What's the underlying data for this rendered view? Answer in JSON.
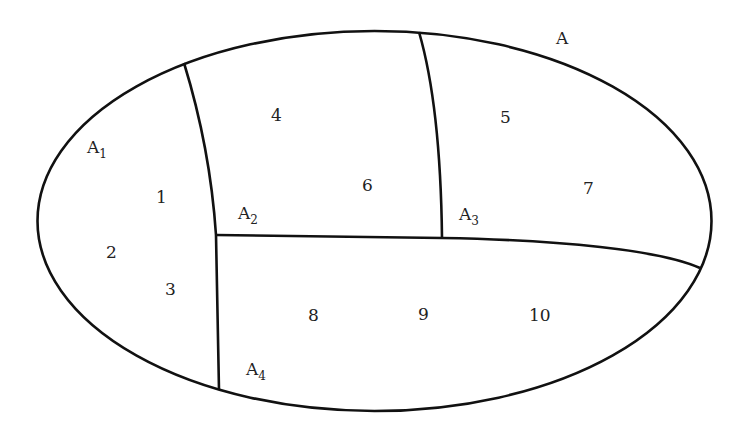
{
  "diagram": {
    "type": "region-partition",
    "stroke_color": "#111111",
    "background": "#ffffff",
    "outer_region": {
      "label": "A"
    },
    "subregions": [
      {
        "id": "A1",
        "base": "A",
        "sub": "1"
      },
      {
        "id": "A2",
        "base": "A",
        "sub": "2"
      },
      {
        "id": "A3",
        "base": "A",
        "sub": "3"
      },
      {
        "id": "A4",
        "base": "A",
        "sub": "4"
      }
    ],
    "numbers": [
      "1",
      "2",
      "3",
      "4",
      "5",
      "6",
      "7",
      "8",
      "9",
      "10"
    ]
  }
}
